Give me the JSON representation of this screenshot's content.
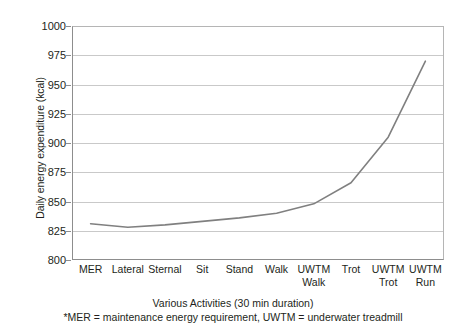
{
  "chart_data": {
    "type": "line",
    "title": "",
    "xlabel": "Various Activities (30 min duration)",
    "ylabel": "Daily energy expenditure (kcal)",
    "categories": [
      "MER",
      "Lateral",
      "Sternal",
      "Sit",
      "Stand",
      "Walk",
      "UWTM Walk",
      "Trot",
      "UWTM Trot",
      "UWTM Run"
    ],
    "category_lines": [
      [
        "MER"
      ],
      [
        "Lateral"
      ],
      [
        "Sternal"
      ],
      [
        "Sit"
      ],
      [
        "Stand"
      ],
      [
        "Walk"
      ],
      [
        "UWTM",
        "Walk"
      ],
      [
        "Trot"
      ],
      [
        "UWTM",
        "Trot"
      ],
      [
        "UWTM",
        "Run"
      ]
    ],
    "values": [
      831,
      828,
      830,
      833,
      836,
      840,
      848,
      866,
      905,
      970
    ],
    "ylim": [
      800,
      1000
    ],
    "yticks": [
      800,
      825,
      850,
      875,
      900,
      925,
      950,
      975,
      1000
    ],
    "ytick_labels": [
      "800",
      "825",
      "850",
      "875",
      "900",
      "925",
      "950",
      "975",
      "1000"
    ],
    "grid": true,
    "legend": "none",
    "series": [
      {
        "name": "Daily energy expenditure",
        "values": [
          831,
          828,
          830,
          833,
          836,
          840,
          848,
          866,
          905,
          970
        ],
        "color": "#808080"
      }
    ]
  },
  "captions": {
    "xlabel": "Various Activities (30 min duration)",
    "footnote": "*MER = maintenance energy requirement, UWTM = underwater treadmill"
  },
  "colors": {
    "line": "#808080",
    "grid": "#c9c9c9",
    "axis": "#8d8d8d",
    "text": "#231f20",
    "background": "#ffffff"
  }
}
